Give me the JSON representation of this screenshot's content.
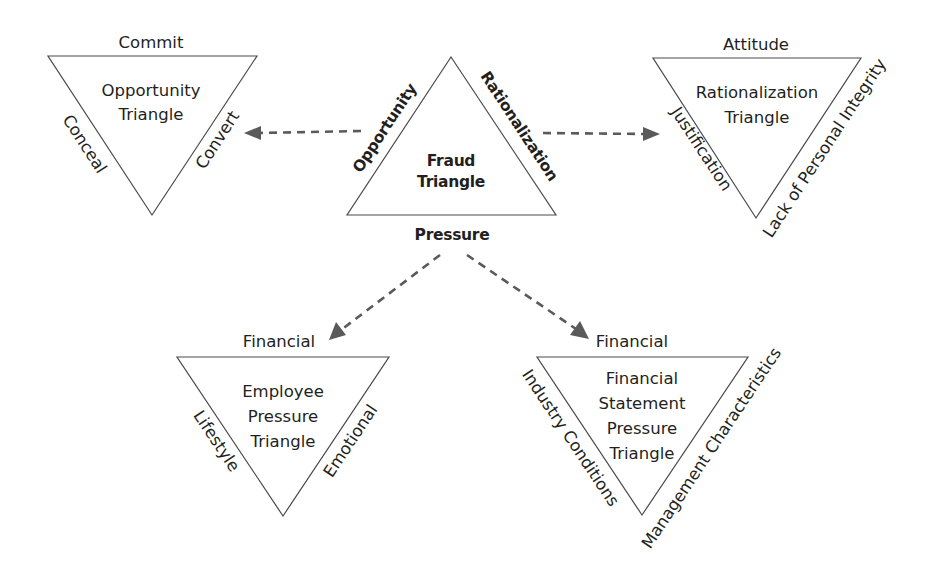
{
  "diagram": {
    "colors": {
      "stroke": "#4a4a4a",
      "arrow": "#5a5a5a",
      "text": "#231f20",
      "background": "#ffffff"
    },
    "fraud_triangle": {
      "title_line1": "Fraud",
      "title_line2": "Triangle",
      "left_side": "Opportunity",
      "right_side": "Rationalization",
      "bottom": "Pressure"
    },
    "opportunity_triangle": {
      "title_line1": "Opportunity",
      "title_line2": "Triangle",
      "top": "Commit",
      "left_side": "Conceal",
      "right_side": "Convert"
    },
    "rationalization_triangle": {
      "title_line1": "Rationalization",
      "title_line2": "Triangle",
      "top": "Attitude",
      "left_side": "Justification",
      "right_side": "Lack of Personal Integrity"
    },
    "employee_pressure_triangle": {
      "title_line1": "Employee",
      "title_line2": "Pressure",
      "title_line3": "Triangle",
      "top": "Financial",
      "left_side": "Lifestyle",
      "right_side": "Emotional"
    },
    "financial_statement_pressure_triangle": {
      "title_line1": "Financial",
      "title_line2": "Statement",
      "title_line3": "Pressure",
      "title_line4": "Triangle",
      "top": "Financial",
      "left_side": "Industry Conditions",
      "right_side": "Management Characteristics"
    },
    "arrows": [
      {
        "from": "Opportunity",
        "to": "Opportunity Triangle",
        "style": "dashed"
      },
      {
        "from": "Rationalization",
        "to": "Rationalization Triangle",
        "style": "dashed"
      },
      {
        "from": "Pressure",
        "to": "Employee Pressure Triangle",
        "style": "dashed"
      },
      {
        "from": "Pressure",
        "to": "Financial Statement Pressure Triangle",
        "style": "dashed"
      }
    ]
  }
}
